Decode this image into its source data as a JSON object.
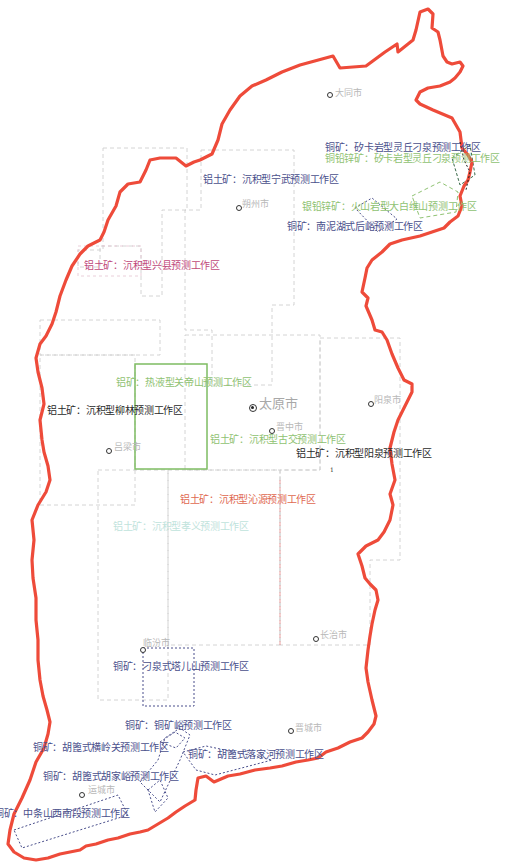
{
  "map": {
    "title": "山西省矿产预测工作区分布",
    "boundary_color": "#ee4b3a",
    "colors": {
      "bauxite_gray": "#c8c8c8",
      "copper_blue": "#4a4f8c",
      "lead_zinc_green": "#8fc272",
      "gold_green": "#6fb25a",
      "bauxite_pink": "#c0487a",
      "bauxite_red": "#e06850",
      "bauxite_cyan": "#bfe3dc",
      "dark_text": "#2a2a2a"
    }
  },
  "cities": [
    {
      "name": "大同市",
      "capital": false
    },
    {
      "name": "朔州市",
      "capital": false
    },
    {
      "name": "忻州市",
      "capital": false
    },
    {
      "name": "太原市",
      "capital": true
    },
    {
      "name": "阳泉市",
      "capital": false
    },
    {
      "name": "晋中市",
      "capital": false
    },
    {
      "name": "吕梁市",
      "capital": false
    },
    {
      "name": "长治市",
      "capital": false
    },
    {
      "name": "临汾市",
      "capital": false
    },
    {
      "name": "晋城市",
      "capital": false
    },
    {
      "name": "运城市",
      "capital": false
    }
  ],
  "work_areas": [
    {
      "label": "铜矿：矽卡岩型灵丘刁泉预测工作区",
      "mineral": "铜矿"
    },
    {
      "label": "铜铅锌矿：矽卡岩型灵丘刁泉预测工作区",
      "mineral": "铜铅锌矿"
    },
    {
      "label": "铝土矿：沉积型宁武预测工作区",
      "mineral": "铝土矿"
    },
    {
      "label": "银铅锌矿：火山岩型大白维山预测工作区",
      "mineral": "银铅锌矿"
    },
    {
      "label": "铜矿：南泥湖式后峪预测工作区",
      "mineral": "铜矿"
    },
    {
      "label": "铝土矿：沉积型兴县预测工作区",
      "mineral": "铝土矿"
    },
    {
      "label": "铝矿：热液型关帝山预测工作区",
      "mineral": "铝矿"
    },
    {
      "label": "铝土矿：沉积型柳林预测工作区",
      "mineral": "铝土矿"
    },
    {
      "label": "铝土矿：沉积型古交预测工作区",
      "mineral": "铝土矿"
    },
    {
      "label": "铝土矿：沉积型阳泉预测工作区",
      "mineral": "铝土矿"
    },
    {
      "label": "铝土矿：沉积型沁源预测工作区",
      "mineral": "铝土矿"
    },
    {
      "label": "铝土矿：沉积型孝义预测工作区",
      "mineral": "铝土矿"
    },
    {
      "label": "铜矿：刁泉式塔儿山预测工作区",
      "mineral": "铜矿"
    },
    {
      "label": "铜矿：铜矿峪预测工作区",
      "mineral": "铜矿"
    },
    {
      "label": "铜矿：胡篦式横岭关预测工作区",
      "mineral": "铜矿"
    },
    {
      "label": "铜矿：胡篦式落家河预测工作区",
      "mineral": "铜矿"
    },
    {
      "label": "铜矿：胡篦式胡家峪预测工作区",
      "mineral": "铜矿"
    },
    {
      "label": "铜矿：中条山西南段预测工作区",
      "mineral": "铜矿"
    }
  ],
  "misc": {
    "stray_mark": "1"
  }
}
